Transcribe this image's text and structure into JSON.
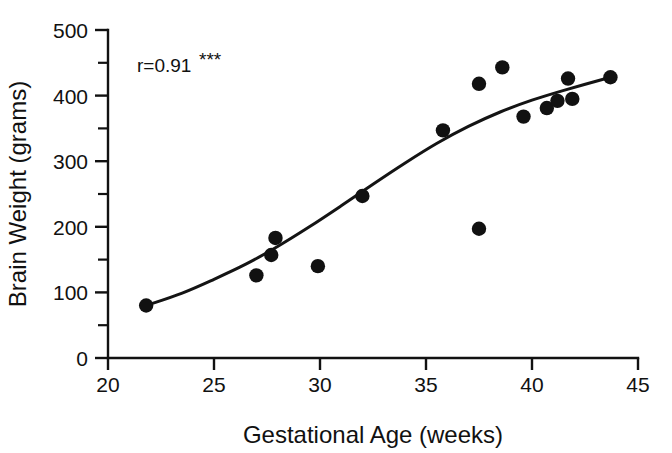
{
  "chart_data": {
    "type": "scatter",
    "title": "",
    "xlabel": "Gestational Age (weeks)",
    "ylabel": "Brain Weight (grams)",
    "xlim": [
      20,
      45
    ],
    "ylim": [
      0,
      500
    ],
    "xticks": [
      20,
      25,
      30,
      35,
      40,
      45
    ],
    "xtick_labels": [
      "20",
      "25",
      "30",
      "35",
      "40",
      "45"
    ],
    "yticks": [
      0,
      100,
      200,
      300,
      400,
      500
    ],
    "ytick_labels": [
      "0",
      "100",
      "200",
      "300",
      "400",
      "500"
    ],
    "y_minor_ticks": [
      50,
      150,
      250,
      350,
      450
    ],
    "grid": false,
    "legend": null,
    "annotations": [
      {
        "name": "correlation-annotation",
        "text": "r=0.91",
        "stars": "***",
        "x": 22.6,
        "y": 452
      }
    ],
    "points": [
      {
        "x": 21.8,
        "y": 80
      },
      {
        "x": 27.0,
        "y": 126
      },
      {
        "x": 27.7,
        "y": 157
      },
      {
        "x": 27.9,
        "y": 183
      },
      {
        "x": 29.9,
        "y": 140
      },
      {
        "x": 32.0,
        "y": 247
      },
      {
        "x": 35.8,
        "y": 347
      },
      {
        "x": 37.5,
        "y": 197
      },
      {
        "x": 37.5,
        "y": 418
      },
      {
        "x": 38.6,
        "y": 443
      },
      {
        "x": 39.6,
        "y": 368
      },
      {
        "x": 40.7,
        "y": 381
      },
      {
        "x": 41.2,
        "y": 392
      },
      {
        "x": 41.7,
        "y": 426
      },
      {
        "x": 41.9,
        "y": 395
      },
      {
        "x": 43.7,
        "y": 428
      }
    ],
    "fit_curve": {
      "name": "smoothed-trend-line",
      "x": [
        21.8,
        23.5,
        25.0,
        26.5,
        28.0,
        29.5,
        31.0,
        32.5,
        34.0,
        35.5,
        37.0,
        38.5,
        40.0,
        41.5,
        43.7
      ],
      "y": [
        80,
        99,
        120,
        143,
        170,
        200,
        232,
        265,
        297,
        327,
        353,
        375,
        393,
        408,
        428
      ]
    }
  },
  "axes": {
    "y_axis_label": "Brain Weight (grams)",
    "x_axis_label": "Gestational Age (weeks)"
  }
}
